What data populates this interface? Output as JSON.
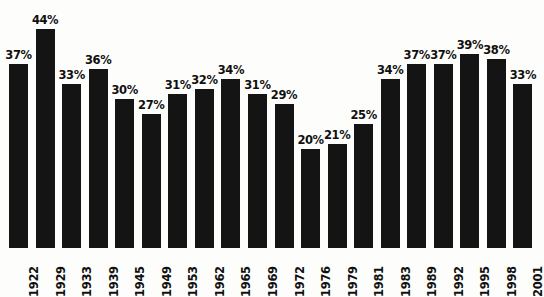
{
  "figure": {
    "background_color": "#fdfdfb",
    "bar_color": "#141414",
    "text_color": "#101010",
    "title_cropped": "........."
  },
  "chart_data": {
    "type": "bar",
    "title": "",
    "xlabel": "",
    "ylabel": "",
    "ylim": [
      0,
      44
    ],
    "grid": false,
    "legend": false,
    "value_suffix": "%",
    "categories": [
      "1922",
      "1929",
      "1933",
      "1939",
      "1945",
      "1949",
      "1953",
      "1962",
      "1965",
      "1969",
      "1972",
      "1976",
      "1979",
      "1981",
      "1983",
      "1989",
      "1992",
      "1995",
      "1998",
      "2001"
    ],
    "values": [
      37,
      44,
      33,
      36,
      30,
      27,
      31,
      32,
      34,
      31,
      29,
      20,
      21,
      25,
      34,
      37,
      37,
      39,
      38,
      33
    ],
    "labels": [
      "37%",
      "44%",
      "33%",
      "36%",
      "30%",
      "27%",
      "31%",
      "32%",
      "34%",
      "31%",
      "29%",
      "20%",
      "21%",
      "25%",
      "34%",
      "37%",
      "37%",
      "39%",
      "38%",
      "33%"
    ]
  }
}
